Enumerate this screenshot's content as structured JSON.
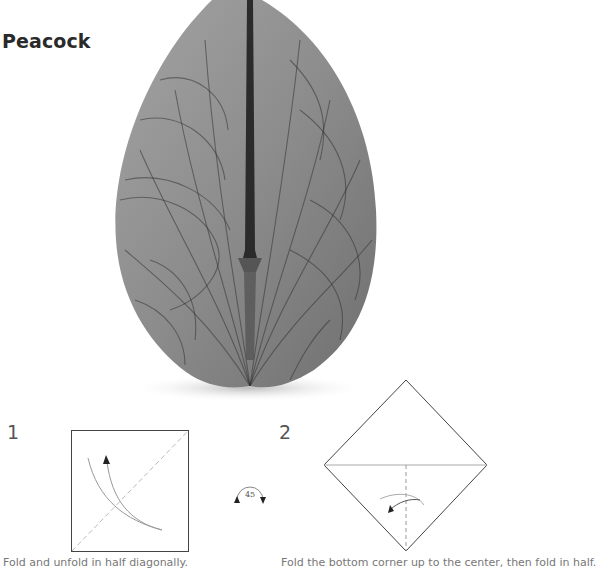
{
  "page": {
    "title": "Peacock"
  },
  "photo": {
    "subject": "Folded origami peacock model with contour-line patterned paper",
    "colors": {
      "paper": "#8a8a8a",
      "lines": "#2e2e2e",
      "shadow": "#d8d8d8"
    }
  },
  "steps": [
    {
      "number": "1",
      "diagram": "square",
      "caption": "Fold and unfold in half diagonally."
    },
    {
      "number": "2",
      "diagram": "diamond",
      "caption": "Fold the bottom corner up to the center, then fold in half."
    }
  ],
  "rotation_symbol": {
    "label": "45"
  }
}
